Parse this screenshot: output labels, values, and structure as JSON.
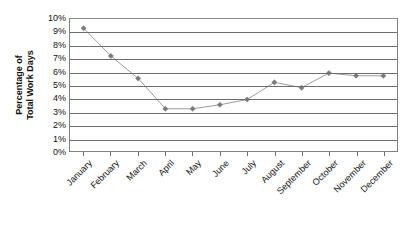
{
  "chart_data": {
    "type": "line",
    "title": "",
    "subtitle": "",
    "xlabel": "",
    "ylabel": "Percentage of Total Work Days",
    "ylabel_lines": [
      "Percentage of",
      "Total Work Days"
    ],
    "categories": [
      "January",
      "February",
      "March",
      "April",
      "May",
      "June",
      "July",
      "August",
      "September",
      "October",
      "November",
      "December"
    ],
    "values": [
      9.3,
      7.2,
      5.5,
      3.2,
      3.2,
      3.5,
      3.9,
      5.2,
      4.8,
      5.9,
      5.7,
      5.7
    ],
    "series": [
      {
        "name": "Percentage of Total Work Days",
        "values": [
          9.3,
          7.2,
          5.5,
          3.2,
          3.2,
          3.5,
          3.9,
          5.2,
          4.8,
          5.9,
          5.7,
          5.7
        ]
      }
    ],
    "ylim": [
      0,
      10
    ],
    "ytick_step": 1,
    "ytick_labels": [
      "10%",
      "9%",
      "8%",
      "7%",
      "6%",
      "5%",
      "4%",
      "3%",
      "2%",
      "1%",
      "0%"
    ],
    "ytick_values": [
      10,
      9,
      8,
      7,
      6,
      5,
      4,
      3,
      2,
      1,
      0
    ],
    "grid": true,
    "grid_axis": "y",
    "legend": false,
    "legend_position": "none",
    "marker": "diamond",
    "line_color": "#9a9a9a",
    "marker_color": "#7a7a7a",
    "grid_color": "#6e6e6e",
    "frame_color": "#808080",
    "background_color": "#ffffff",
    "text_color": "#111111"
  }
}
